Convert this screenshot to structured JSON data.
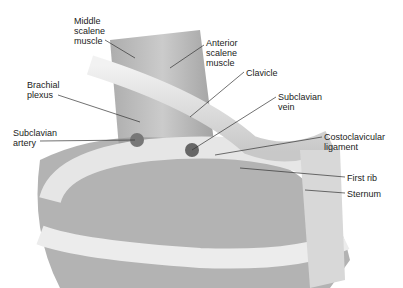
{
  "diagram": {
    "labels": [
      {
        "id": "middle-scalene",
        "text": "Middle\nscalene\nmuscle",
        "x": 74,
        "y": 16
      },
      {
        "id": "anterior-scalene",
        "text": "Anterior\nscalene\nmuscle",
        "x": 206,
        "y": 38
      },
      {
        "id": "clavicle",
        "text": "Clavicle",
        "x": 246,
        "y": 68
      },
      {
        "id": "brachial-plexus",
        "text": "Brachial\nplexus",
        "x": 27,
        "y": 80
      },
      {
        "id": "subclavian-vein",
        "text": "Subclavian\nvein",
        "x": 278,
        "y": 92
      },
      {
        "id": "subclavian-artery",
        "text": "Subclavian\nartery",
        "x": 13,
        "y": 128
      },
      {
        "id": "costoclavicular-ligament",
        "text": "Costoclavicular\nligament",
        "x": 324,
        "y": 132
      },
      {
        "id": "first-rib",
        "text": "First rib",
        "x": 347,
        "y": 173
      },
      {
        "id": "sternum",
        "text": "Sternum",
        "x": 347,
        "y": 189
      }
    ]
  }
}
